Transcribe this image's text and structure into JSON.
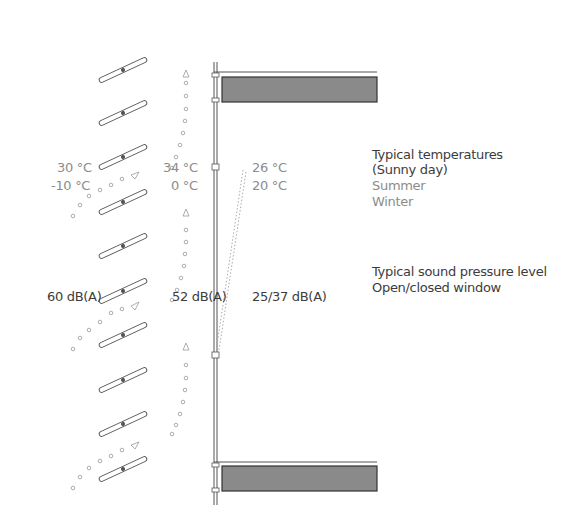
{
  "legend": {
    "temperatures_title": "Typical temperatures",
    "temperatures_subtitle": "(Sunny day)",
    "summer": "Summer",
    "winter": "Winter",
    "sound_title": "Typical sound pressure level",
    "sound_subtitle": "Open/closed window"
  },
  "temperatures": {
    "outside_summer": "30 °C",
    "outside_winter": "-10 °C",
    "cavity_summer": "34 °C",
    "cavity_winter": "0 °C",
    "inside_summer": "26 °C",
    "inside_winter": "20 °C"
  },
  "sound": {
    "outside": "60 dB(A)",
    "cavity": "52 dB(A)",
    "inside": "25/37 dB(A)"
  },
  "colors": {
    "floor_slab": "#8a8a8a",
    "line": "#555555",
    "summer_text": "#8c8c8c",
    "winter_text": "#3c3c3c"
  }
}
